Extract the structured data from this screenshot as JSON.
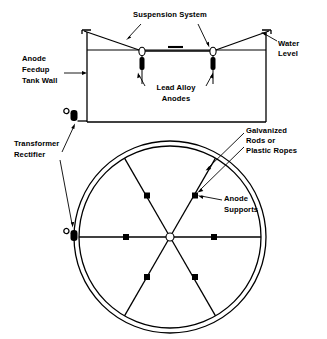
{
  "figure": {
    "views": {
      "elevation": "elevation-view",
      "plan": "plan-view"
    }
  },
  "labels": {
    "suspension_system": "Suspension System",
    "water_level_line1": "Water",
    "water_level_line2": "Level",
    "anode_feedup_line1": "Anode",
    "anode_feedup_line2": "Feedup",
    "anode_feedup_line3": "Tank Wall",
    "lead_alloy_line1": "Lead Alloy",
    "lead_alloy_line2": "Anodes",
    "transformer_line1": "Transformer",
    "transformer_line2": "Rectifier",
    "galvanized_line1": "Galvanized",
    "galvanized_line2": "Rods or",
    "galvanized_line3": "Plastic Ropes",
    "anode_supports_line1": "Anode",
    "anode_supports_line2": "Supports"
  },
  "colors": {
    "ink": "#000000",
    "paper": "#ffffff"
  },
  "plan_view": {
    "spoke_count": 6,
    "anode_marker_count": 6,
    "hub": "center-hub"
  },
  "elevation_view": {
    "anode_count": 2,
    "rectifier_count": 1
  }
}
